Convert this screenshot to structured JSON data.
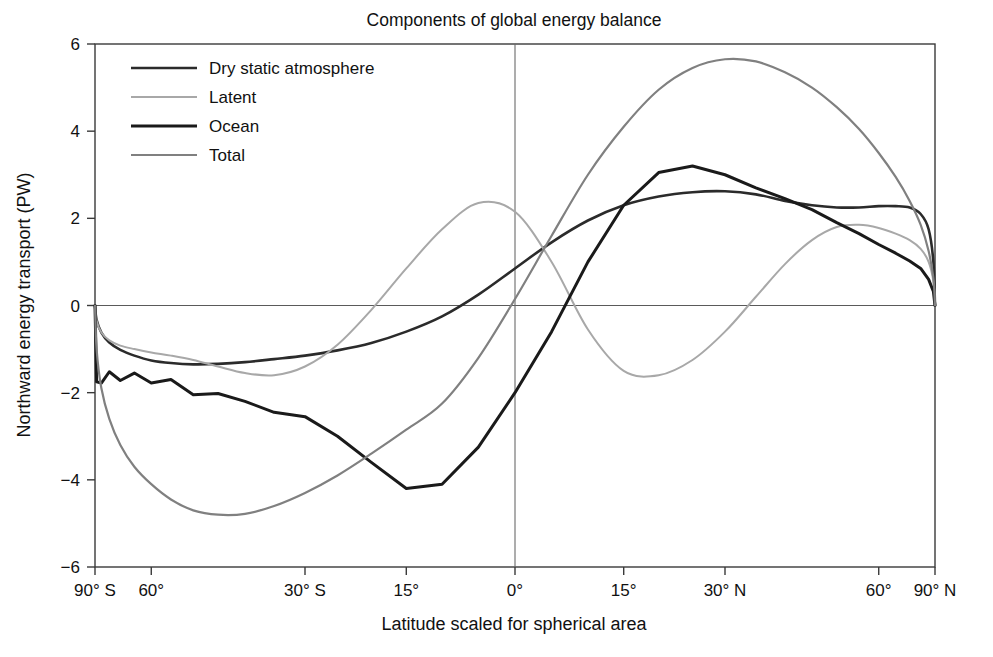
{
  "chart_data": {
    "type": "line",
    "title": "Components of global energy balance",
    "xlabel": "Latitude scaled for spherical area",
    "ylabel": "Northward energy transport (PW)",
    "x_scale": "sine-of-latitude (equal spherical area)",
    "xlim": [
      -90,
      90
    ],
    "ylim": [
      -6,
      6
    ],
    "grid": false,
    "legend_position": "upper-left-inside",
    "x_tick_labels": [
      "90° S",
      "60°",
      "30° S",
      "15°",
      "0°",
      "15°",
      "30° N",
      "60°",
      "90° N"
    ],
    "x_tick_values": [
      -90,
      -60,
      -30,
      -15,
      0,
      15,
      30,
      60,
      90
    ],
    "y_tick_labels": [
      "6",
      "4",
      "2",
      "0",
      "−2",
      "−4",
      "−6"
    ],
    "y_tick_values": [
      6,
      4,
      2,
      0,
      -2,
      -4,
      -6
    ],
    "zero_reference_lines": {
      "horizontal_y": 0,
      "vertical_x": 0
    },
    "x": [
      -90,
      -85,
      -80,
      -75,
      -70,
      -65,
      -60,
      -55,
      -50,
      -45,
      -40,
      -35,
      -30,
      -25,
      -20,
      -15,
      -10,
      -5,
      0,
      5,
      10,
      15,
      20,
      25,
      30,
      35,
      40,
      45,
      50,
      55,
      60,
      65,
      70,
      75,
      80,
      85,
      90
    ],
    "series": [
      {
        "name": "Dry static atmosphere",
        "color": "#2b2b2b",
        "line_width": 2.6,
        "values": [
          0.0,
          -0.33,
          -0.62,
          -0.85,
          -1.02,
          -1.15,
          -1.26,
          -1.32,
          -1.35,
          -1.34,
          -1.3,
          -1.23,
          -1.15,
          -1.03,
          -0.86,
          -0.6,
          -0.25,
          0.25,
          0.85,
          1.45,
          1.95,
          2.3,
          2.5,
          2.6,
          2.62,
          2.55,
          2.4,
          2.3,
          2.25,
          2.25,
          2.28,
          2.28,
          2.25,
          2.1,
          1.75,
          1.0,
          0.0
        ],
        "min": {
          "value": -1.35,
          "at_latitude": -50
        },
        "max": {
          "value": 2.62,
          "at_latitude": 30
        }
      },
      {
        "name": "Latent",
        "color": "#a8a8a8",
        "line_width": 2.0,
        "values": [
          0.0,
          -0.35,
          -0.62,
          -0.8,
          -0.92,
          -1.0,
          -1.08,
          -1.15,
          -1.25,
          -1.4,
          -1.55,
          -1.6,
          -1.4,
          -0.9,
          -0.1,
          0.85,
          1.75,
          2.35,
          2.15,
          1.0,
          -0.55,
          -1.5,
          -1.6,
          -1.25,
          -0.6,
          0.2,
          0.95,
          1.5,
          1.8,
          1.85,
          1.78,
          1.65,
          1.5,
          1.3,
          1.0,
          0.55,
          0.0
        ],
        "min": {
          "value": -1.6,
          "at_latitude": 13
        },
        "max": {
          "value": 2.4,
          "at_latitude": -7
        }
      },
      {
        "name": "Ocean",
        "color": "#1a1a1a",
        "line_width": 3.0,
        "values": [
          0.0,
          -1.75,
          -1.78,
          -1.52,
          -1.72,
          -1.55,
          -1.78,
          -1.7,
          -2.05,
          -2.02,
          -2.2,
          -2.45,
          -2.55,
          -3.0,
          -3.6,
          -4.2,
          -4.1,
          -3.25,
          -2.0,
          -0.6,
          1.0,
          2.3,
          3.05,
          3.2,
          3.0,
          2.7,
          2.45,
          2.2,
          1.9,
          1.65,
          1.4,
          1.2,
          1.02,
          0.85,
          0.6,
          0.32,
          0.0
        ],
        "min": {
          "value": -4.2,
          "at_latitude": -15
        },
        "max": {
          "value": 3.2,
          "at_latitude": 16
        }
      },
      {
        "name": "Total",
        "color": "#808080",
        "line_width": 2.2,
        "values": [
          0.0,
          -1.0,
          -1.9,
          -2.6,
          -3.2,
          -3.7,
          -4.1,
          -4.45,
          -4.7,
          -4.8,
          -4.78,
          -4.6,
          -4.3,
          -3.9,
          -3.4,
          -2.85,
          -2.25,
          -1.2,
          0.15,
          1.6,
          3.0,
          4.1,
          4.95,
          5.45,
          5.65,
          5.6,
          5.35,
          5.0,
          4.55,
          4.05,
          3.5,
          2.95,
          2.4,
          1.85,
          1.25,
          0.62,
          0.0
        ],
        "min": {
          "value": -4.8,
          "at_latitude": -45
        },
        "max": {
          "value": 5.65,
          "at_latitude": 32
        }
      }
    ]
  },
  "legend": {
    "items": [
      {
        "label": "Dry static atmosphere"
      },
      {
        "label": "Latent"
      },
      {
        "label": "Ocean"
      },
      {
        "label": "Total"
      }
    ]
  }
}
